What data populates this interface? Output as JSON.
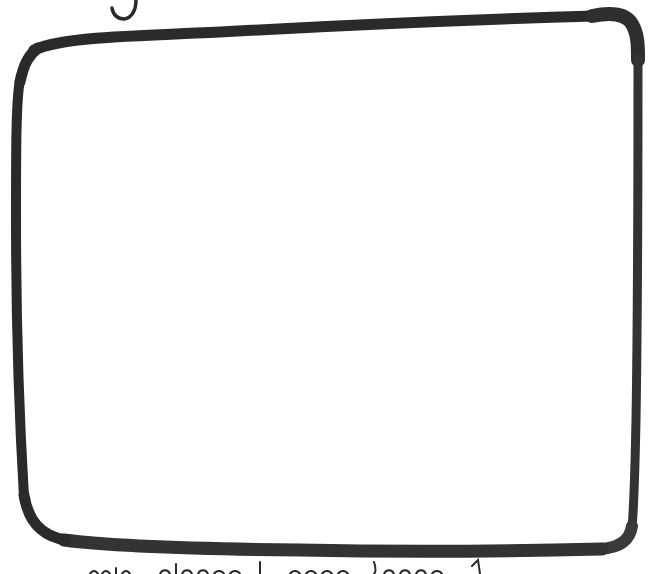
{
  "canvas": {
    "width": 654,
    "height": 574,
    "background": "#ffffff",
    "ink_color": "#2a2a2a",
    "ink_color_light": "#4a4a4a"
  },
  "sketch": {
    "shape": "hand-drawn rounded rectangle",
    "top_glyph": "partial handwritten letter (cut off at top edge)",
    "bottom_caption": "handwritten caption (cut off at bottom edge, illegible)"
  }
}
